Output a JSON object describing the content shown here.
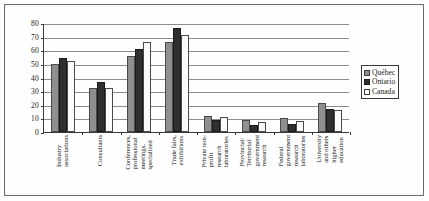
{
  "chart_data": {
    "type": "bar",
    "title": "",
    "xlabel": "",
    "ylabel": "",
    "ylim": [
      0,
      80
    ],
    "yticks": [
      0,
      10,
      20,
      30,
      40,
      50,
      60,
      70,
      80
    ],
    "grid": true,
    "legend_position": "right",
    "categories": [
      "Industry associations",
      "Consultants",
      "Conferences, professional meetings, specialized",
      "Trade fairs, exhibitions",
      "Private non-profit research laboratories",
      "Provincial/ Territorial government research",
      "Federal government research laboratories",
      "University and others higher education"
    ],
    "category_lines": [
      [
        "Industry",
        "associations"
      ],
      [
        "Consultants"
      ],
      [
        "Conferences,",
        "professional",
        "meetings,",
        "specialized"
      ],
      [
        "Trade fairs,",
        "exhibitions"
      ],
      [
        "Private non-",
        "profit",
        "research",
        "laboratories"
      ],
      [
        "Provincial/",
        "Territorial",
        "government",
        "research"
      ],
      [
        "Federal",
        "government",
        "research",
        "laboratories"
      ],
      [
        "University",
        "and others",
        "higher",
        "education"
      ]
    ],
    "series": [
      {
        "name": "Québec",
        "color": "#8f8f8f",
        "values": [
          50,
          32,
          56,
          66,
          12,
          9,
          10,
          21
        ]
      },
      {
        "name": "Ontario",
        "color": "#2f2f2f",
        "values": [
          54,
          37,
          61,
          76,
          9,
          5,
          6,
          17
        ]
      },
      {
        "name": "Canada",
        "color": "#ffffff",
        "values": [
          52,
          32,
          66,
          71,
          11,
          7,
          8,
          16
        ]
      }
    ]
  },
  "legend": {
    "items": [
      {
        "label": "Québec"
      },
      {
        "label": "Ontario"
      },
      {
        "label": "Canada"
      }
    ]
  }
}
